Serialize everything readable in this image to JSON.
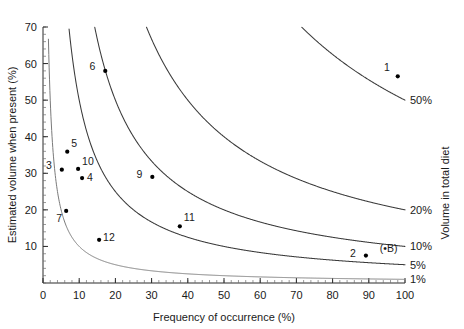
{
  "chart_data": {
    "type": "scatter",
    "title": "",
    "xlabel": "Frequency of occurrence (%)",
    "ylabel": "Estimated volume when present (%)",
    "y2label": "Volume in total diet",
    "xlim": [
      0,
      100
    ],
    "ylim": [
      0,
      70
    ],
    "grid": false,
    "legend": "none",
    "xticks": [
      0,
      10,
      20,
      30,
      40,
      50,
      60,
      70,
      80,
      90,
      100
    ],
    "xticklabels": [
      "0",
      "10",
      "20",
      "30",
      "40",
      "50",
      "60",
      "70",
      "80",
      "90",
      "100"
    ],
    "yticks": [
      10,
      20,
      30,
      40,
      50,
      60,
      70
    ],
    "yticklabels": [
      "10",
      "20",
      "30",
      "40",
      "50",
      "60",
      "70"
    ],
    "xminor_step": 2,
    "yminor_step": 2,
    "points": [
      {
        "label": "1",
        "x": 98.0,
        "y": 56.5,
        "label_dx": -8,
        "label_dy": -5
      },
      {
        "label": "2",
        "x": 89.2,
        "y": 7.5,
        "label_dx": -10,
        "label_dy": 1
      },
      {
        "label": "3",
        "x": 5.2,
        "y": 31.0,
        "label_dx": -10,
        "label_dy": -1
      },
      {
        "label": "4",
        "x": 10.8,
        "y": 28.7,
        "label_dx": 5,
        "label_dy": 3
      },
      {
        "label": "5",
        "x": 6.7,
        "y": 35.9,
        "label_dx": 4,
        "label_dy": -5
      },
      {
        "label": "6",
        "x": 17.2,
        "y": 58.0,
        "label_dx": -10,
        "label_dy": -1
      },
      {
        "label": "7",
        "x": 6.4,
        "y": 19.7,
        "label_dx": -4,
        "label_dy": 11
      },
      {
        "label": "9",
        "x": 30.2,
        "y": 29.0,
        "label_dx": -10,
        "label_dy": 1
      },
      {
        "label": "10",
        "x": 9.7,
        "y": 31.2,
        "label_dx": 4,
        "label_dy": -4
      },
      {
        "label": "11",
        "x": 37.8,
        "y": 15.5,
        "label_dx": 4,
        "label_dy": -5
      },
      {
        "label": "12",
        "x": 15.5,
        "y": 11.8,
        "label_dx": 4,
        "label_dy": 1
      }
    ],
    "extra_labels": [
      {
        "text": "(•B)",
        "x": 95.5,
        "y": 8.4
      }
    ],
    "isopleths": [
      {
        "label": "1%",
        "k": 1
      },
      {
        "label": "5%",
        "k": 5
      },
      {
        "label": "10%",
        "k": 10
      },
      {
        "label": "20%",
        "k": 20
      },
      {
        "label": "50%",
        "k": 50
      }
    ]
  }
}
